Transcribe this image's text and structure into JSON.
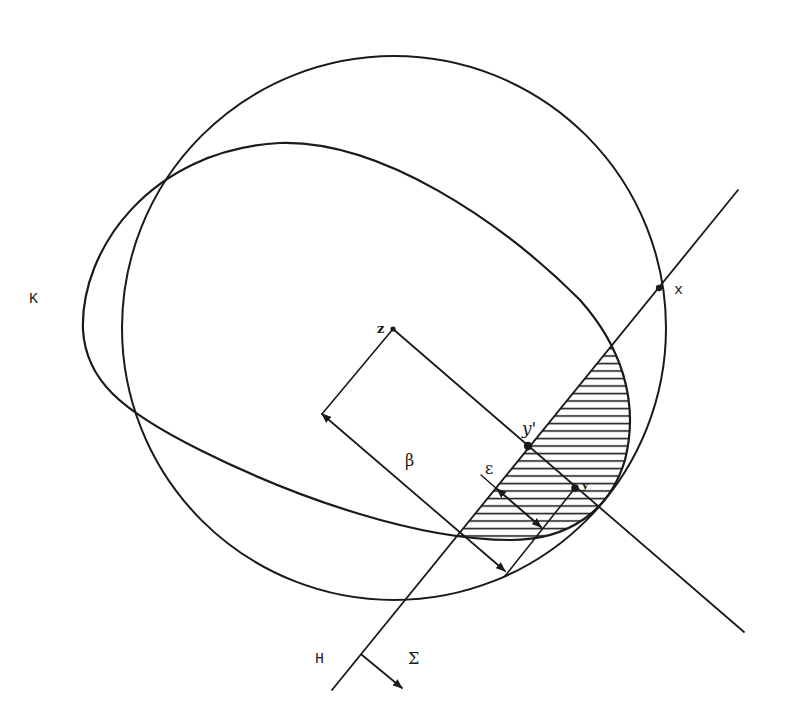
{
  "figure": {
    "type": "geometric-diagram",
    "colors": {
      "ink": "#1a1a1a",
      "background": "#ffffff"
    },
    "labels": {
      "K": "K",
      "x": "x",
      "z": "z",
      "y_prime": "y'",
      "y": "y",
      "beta": "β",
      "epsilon": "ε",
      "H": "H",
      "Sigma": "Σ"
    },
    "shapes": {
      "circle": {
        "cx": 394,
        "cy": 328,
        "r": 272
      },
      "convex_body_K": "tilted egg-shaped oval",
      "hyperplane_H": {
        "from": [
          332,
          690
        ],
        "to": [
          738,
          190
        ]
      },
      "hatched_region": "cap of K cut off by H (side Σ)"
    },
    "points": {
      "x": [
        659,
        288
      ],
      "z": [
        393,
        329
      ],
      "y_prime": [
        528,
        446
      ],
      "y": [
        575,
        488
      ]
    }
  }
}
